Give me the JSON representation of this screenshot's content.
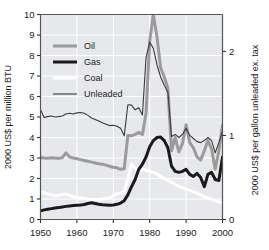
{
  "chart_data": {
    "type": "line",
    "title": "",
    "xlabel": "",
    "ylabel": "2000 US$ per million BTU",
    "ylabel_right": "2000 US$ per gallon unleaded ex. tax",
    "xlim": [
      1950,
      2000
    ],
    "ylim": [
      0,
      10
    ],
    "ylim_right": [
      0,
      2.439
    ],
    "xticks": [
      1950,
      1960,
      1970,
      1980,
      1990,
      2000
    ],
    "xtick_labels": [
      "1950",
      "1960",
      "1970",
      "1980",
      "1990",
      "2000"
    ],
    "yticks": [
      0,
      1,
      2,
      3,
      4,
      5,
      6,
      7,
      8,
      9,
      10
    ],
    "ytick_labels": [
      "0",
      "1",
      "2",
      "3",
      "4",
      "5",
      "6",
      "7",
      "8",
      "9",
      "10"
    ],
    "yticks_right": [
      0,
      1,
      2
    ],
    "ytick_labels_right": [
      "0",
      "1",
      "2"
    ],
    "grid": true,
    "grid_color": "#ffffff",
    "plot_background": "#e6e8ec",
    "legend_position": "upper-left",
    "x": [
      1950,
      1951,
      1952,
      1953,
      1954,
      1955,
      1956,
      1957,
      1958,
      1959,
      1960,
      1961,
      1962,
      1963,
      1964,
      1965,
      1966,
      1967,
      1968,
      1969,
      1970,
      1971,
      1972,
      1973,
      1974,
      1975,
      1976,
      1977,
      1978,
      1979,
      1980,
      1981,
      1982,
      1983,
      1984,
      1985,
      1986,
      1987,
      1988,
      1989,
      1990,
      1991,
      1992,
      1993,
      1994,
      1995,
      1996,
      1997,
      1998,
      1999,
      2000
    ],
    "series": [
      {
        "name": "Oil",
        "color": "#9b9b9b",
        "width": 3.0,
        "values": [
          3.02,
          3.0,
          2.99,
          3.01,
          3.0,
          2.98,
          3.02,
          3.25,
          3.05,
          3.0,
          2.96,
          2.92,
          2.88,
          2.84,
          2.8,
          2.76,
          2.72,
          2.7,
          2.65,
          2.6,
          2.55,
          2.52,
          2.45,
          2.48,
          4.1,
          4.08,
          4.15,
          4.25,
          4.15,
          5.2,
          8.7,
          10.0,
          8.9,
          7.4,
          6.95,
          6.4,
          3.35,
          4.0,
          3.3,
          3.7,
          4.62,
          3.75,
          3.5,
          3.05,
          2.9,
          3.35,
          3.85,
          3.45,
          2.45,
          3.35,
          4.6
        ]
      },
      {
        "name": "Gas",
        "color": "#1a1a1a",
        "width": 3.0,
        "values": [
          0.42,
          0.47,
          0.5,
          0.53,
          0.56,
          0.58,
          0.61,
          0.64,
          0.66,
          0.68,
          0.7,
          0.71,
          0.73,
          0.78,
          0.82,
          0.78,
          0.74,
          0.72,
          0.71,
          0.7,
          0.71,
          0.74,
          0.8,
          0.92,
          1.2,
          1.6,
          1.95,
          2.45,
          2.7,
          3.05,
          3.55,
          3.85,
          4.0,
          4.02,
          3.85,
          3.5,
          2.6,
          2.35,
          2.3,
          2.35,
          2.45,
          2.2,
          2.1,
          2.25,
          2.05,
          1.6,
          2.2,
          2.3,
          1.95,
          1.9,
          3.05
        ]
      },
      {
        "name": "Coal",
        "color": "#ffffff",
        "width": 3.0,
        "values": [
          1.35,
          1.3,
          1.25,
          1.2,
          1.15,
          1.18,
          1.22,
          1.25,
          1.18,
          1.12,
          1.08,
          1.05,
          1.02,
          1.0,
          0.98,
          0.97,
          0.98,
          1.0,
          1.02,
          1.05,
          1.15,
          1.25,
          1.3,
          1.35,
          2.0,
          2.7,
          2.5,
          2.4,
          2.45,
          2.4,
          2.35,
          2.3,
          2.22,
          2.1,
          2.0,
          1.92,
          1.82,
          1.72,
          1.62,
          1.55,
          1.48,
          1.42,
          1.35,
          1.28,
          1.2,
          1.12,
          1.05,
          0.98,
          0.92,
          0.86,
          0.8
        ]
      },
      {
        "name": "Unleaded",
        "color": "#3a3a3a",
        "width": 1.1,
        "values": [
          5.35,
          4.98,
          5.02,
          5.05,
          5.0,
          5.02,
          5.05,
          5.15,
          5.18,
          5.15,
          5.2,
          5.22,
          5.18,
          5.08,
          4.95,
          4.88,
          4.8,
          4.72,
          4.65,
          4.58,
          4.6,
          4.55,
          4.45,
          4.08,
          5.6,
          5.58,
          5.35,
          5.45,
          5.1,
          7.9,
          8.65,
          8.35,
          7.55,
          6.95,
          6.55,
          6.2,
          4.05,
          4.15,
          4.0,
          4.15,
          4.45,
          4.1,
          3.95,
          3.8,
          3.75,
          3.85,
          4.0,
          3.85,
          3.25,
          3.75,
          4.3
        ]
      }
    ],
    "legend": [
      {
        "label": "Oil",
        "color": "#9b9b9b",
        "width": 3.0
      },
      {
        "label": "Gas",
        "color": "#1a1a1a",
        "width": 3.0
      },
      {
        "label": "Coal",
        "color": "#ffffff",
        "width": 3.0
      },
      {
        "label": "Unleaded",
        "color": "#3a3a3a",
        "width": 1.1
      }
    ]
  }
}
